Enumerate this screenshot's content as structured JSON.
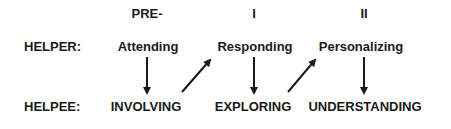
{
  "stages": [
    {
      "label": "PRE-"
    },
    {
      "label": "I"
    },
    {
      "label": "II"
    }
  ],
  "rows": {
    "helper": {
      "label": "HELPER:",
      "items": [
        "Attending",
        "Responding",
        "Personalizing"
      ]
    },
    "helpee": {
      "label": "HELPEE:",
      "items": [
        "INVOLVING",
        "EXPLORING",
        "UNDERSTANDING"
      ]
    }
  },
  "arrows": [
    {
      "from": "Attending",
      "to": "INVOLVING",
      "direction": "down"
    },
    {
      "from": "INVOLVING",
      "to": "Responding",
      "direction": "diagonal-up"
    },
    {
      "from": "Responding",
      "to": "EXPLORING",
      "direction": "down"
    },
    {
      "from": "EXPLORING",
      "to": "Personalizing",
      "direction": "diagonal-up"
    },
    {
      "from": "Personalizing",
      "to": "UNDERSTANDING",
      "direction": "down"
    }
  ],
  "colors": {
    "text": "#1a1a1a",
    "arrow": "#1a1a1a",
    "background": "#ffffff"
  }
}
